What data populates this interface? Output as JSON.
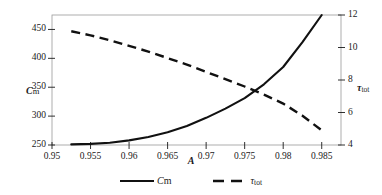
{
  "chart_data": {
    "type": "line",
    "title": "",
    "xlabel": "A",
    "xlim": [
      0.95,
      0.9875
    ],
    "xticks": [
      0.95,
      0.955,
      0.96,
      0.965,
      0.97,
      0.975,
      0.98,
      0.985
    ],
    "xtick_labels": [
      "0.95",
      "0.955",
      "0.96",
      "0.965",
      "0.97",
      "0.975",
      "0.98",
      "0.985"
    ],
    "grid": false,
    "legend_position": "bottom-center",
    "axes": [
      {
        "id": "left",
        "label_symbol": "C",
        "label_sub": "m",
        "label_text": "Cm",
        "ylim": [
          250,
          475
        ],
        "yticks": [
          250,
          300,
          350,
          400,
          450
        ],
        "ytick_labels": [
          "250",
          "300",
          "350",
          "400",
          "450"
        ]
      },
      {
        "id": "right",
        "label_symbol": "τ",
        "label_sub": "tot",
        "label_text": "τtot",
        "ylim": [
          4,
          12
        ],
        "yticks": [
          4,
          6,
          8,
          10,
          12
        ],
        "ytick_labels": [
          "4",
          "6",
          "8",
          "10",
          "12"
        ]
      }
    ],
    "series": [
      {
        "name": "Cm",
        "label_symbol": "C",
        "label_sub": "m",
        "axis": "left",
        "style": "solid",
        "color": "#111111",
        "x": [
          0.9525,
          0.955,
          0.9575,
          0.96,
          0.9625,
          0.965,
          0.9675,
          0.97,
          0.9725,
          0.975,
          0.9775,
          0.98,
          0.9825,
          0.985
        ],
        "y": [
          251,
          252,
          254,
          258,
          264,
          272,
          283,
          297,
          313,
          331,
          355,
          385,
          428,
          475
        ]
      },
      {
        "name": "τtot",
        "label_symbol": "τ",
        "label_sub": "tot",
        "axis": "right",
        "style": "dashed",
        "color": "#111111",
        "x": [
          0.9525,
          0.955,
          0.9575,
          0.96,
          0.9625,
          0.965,
          0.9675,
          0.97,
          0.9725,
          0.975,
          0.9775,
          0.98,
          0.9825,
          0.985
        ],
        "y": [
          11.0,
          10.75,
          10.45,
          10.1,
          9.75,
          9.35,
          8.95,
          8.5,
          8.05,
          7.6,
          7.1,
          6.55,
          5.8,
          4.9
        ]
      }
    ]
  }
}
